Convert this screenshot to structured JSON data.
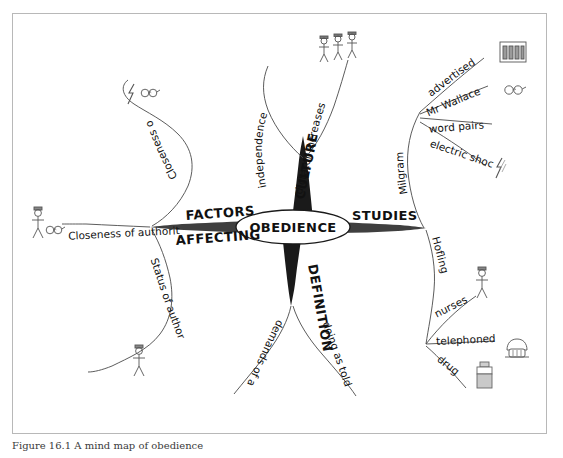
{
  "figure": {
    "caption": "Figure 16.1 A mind map of obedience",
    "border_color": "#b8b8b8",
    "background": "#ffffff",
    "ink_color": "#111111"
  },
  "mindmap": {
    "center": {
      "label": "OBEDIENCE",
      "shape": "ellipse"
    },
    "branches": [
      {
        "id": "culture",
        "label": "CULTURE",
        "direction": "up",
        "children": [
          {
            "label": "independence",
            "icon": null
          },
          {
            "label": "dictator increases",
            "icon": "three-people-icon"
          }
        ]
      },
      {
        "id": "studies",
        "label": "STUDIES",
        "direction": "right",
        "children": [
          {
            "label": "Milgram",
            "children": [
              {
                "label": "advertised",
                "icon": "newspaper-icon"
              },
              {
                "label": "Mr Wallace",
                "icon": "glasses-icon"
              },
              {
                "label": "word pairs",
                "icon": null
              },
              {
                "label": "electric shock",
                "icon": "lightning-icon"
              }
            ]
          },
          {
            "label": "Hofling",
            "children": [
              {
                "label": "nurses",
                "icon": "nurse-figure-icon"
              },
              {
                "label": "telephoned",
                "icon": "telephone-icon"
              },
              {
                "label": "drug",
                "icon": "medicine-bottle-icon"
              }
            ]
          }
        ]
      },
      {
        "id": "definition",
        "label": "DEFINITION",
        "direction": "down",
        "children": [
          {
            "label": "demands of authority figure",
            "icon": null
          },
          {
            "label": "doing as told",
            "icon": null
          }
        ]
      },
      {
        "id": "factors-affecting",
        "label_line1": "FACTORS",
        "label_line2": "AFFECTING",
        "direction": "left",
        "children": [
          {
            "label": "Closeness of learner",
            "icon": "lightning-glasses-icon"
          },
          {
            "label": "Closeness of authority figure",
            "icon": "figure-glasses-icon"
          },
          {
            "label": "Status of authority figure",
            "icon": "small-figure-icon"
          }
        ]
      }
    ]
  }
}
